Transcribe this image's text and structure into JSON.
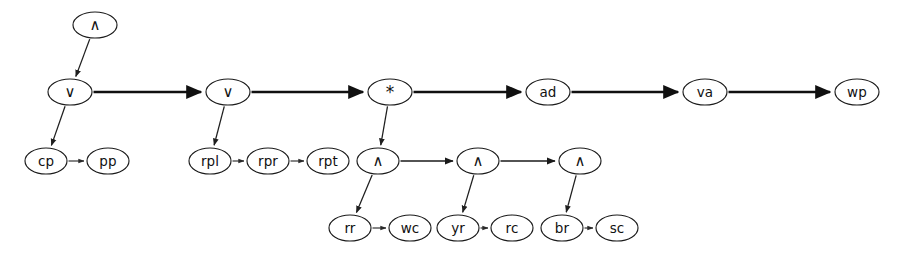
{
  "diagram": {
    "background_color": "#ffffff",
    "stroke_color": "#1b1b1b",
    "width": 906,
    "height": 254,
    "nodes": [
      {
        "id": "and_root",
        "label": "∧",
        "kind": "and-operator",
        "x": 95,
        "y": 25,
        "rx": 22,
        "ry": 13
      },
      {
        "id": "or_1",
        "label": "∨",
        "kind": "or-operator",
        "x": 70,
        "y": 92,
        "rx": 22,
        "ry": 13
      },
      {
        "id": "cp",
        "label": "cp",
        "kind": "leaf",
        "x": 46,
        "y": 161,
        "rx": 21,
        "ry": 13
      },
      {
        "id": "pp",
        "label": "pp",
        "kind": "leaf",
        "x": 108,
        "y": 161,
        "rx": 21,
        "ry": 13
      },
      {
        "id": "or_2",
        "label": "∨",
        "kind": "or-operator",
        "x": 228,
        "y": 92,
        "rx": 22,
        "ry": 13
      },
      {
        "id": "rpl",
        "label": "rpl",
        "kind": "leaf",
        "x": 210,
        "y": 161,
        "rx": 21,
        "ry": 13
      },
      {
        "id": "rpr",
        "label": "rpr",
        "kind": "leaf",
        "x": 268,
        "y": 161,
        "rx": 21,
        "ry": 13
      },
      {
        "id": "rpt",
        "label": "rpt",
        "kind": "leaf",
        "x": 328,
        "y": 161,
        "rx": 21,
        "ry": 13
      },
      {
        "id": "star",
        "label": "*",
        "kind": "star-operator",
        "x": 390,
        "y": 92,
        "rx": 22,
        "ry": 13
      },
      {
        "id": "and_1",
        "label": "∧",
        "kind": "and-operator",
        "x": 378,
        "y": 161,
        "rx": 21,
        "ry": 13
      },
      {
        "id": "rr",
        "label": "rr",
        "kind": "leaf",
        "x": 350,
        "y": 228,
        "rx": 21,
        "ry": 13
      },
      {
        "id": "wc",
        "label": "wc",
        "kind": "leaf",
        "x": 410,
        "y": 228,
        "rx": 21,
        "ry": 13
      },
      {
        "id": "and_2",
        "label": "∧",
        "kind": "and-operator",
        "x": 478,
        "y": 161,
        "rx": 21,
        "ry": 13
      },
      {
        "id": "yr",
        "label": "yr",
        "kind": "leaf",
        "x": 458,
        "y": 228,
        "rx": 21,
        "ry": 13
      },
      {
        "id": "rc",
        "label": "rc",
        "kind": "leaf",
        "x": 512,
        "y": 228,
        "rx": 21,
        "ry": 13
      },
      {
        "id": "and_3",
        "label": "∧",
        "kind": "and-operator",
        "x": 580,
        "y": 161,
        "rx": 21,
        "ry": 13
      },
      {
        "id": "br",
        "label": "br",
        "kind": "leaf",
        "x": 562,
        "y": 228,
        "rx": 21,
        "ry": 13
      },
      {
        "id": "sc",
        "label": "sc",
        "kind": "leaf",
        "x": 617,
        "y": 228,
        "rx": 21,
        "ry": 13
      },
      {
        "id": "ad",
        "label": "ad",
        "kind": "leaf",
        "x": 548,
        "y": 92,
        "rx": 22,
        "ry": 13
      },
      {
        "id": "va",
        "label": "va",
        "kind": "leaf",
        "x": 705,
        "y": 92,
        "rx": 22,
        "ry": 13
      },
      {
        "id": "wp",
        "label": "wp",
        "kind": "leaf",
        "x": 857,
        "y": 92,
        "rx": 22,
        "ry": 13
      }
    ],
    "edges": [
      {
        "id": "e_and_root_or1",
        "from": "and_root",
        "to": "or_1",
        "style": "diagonal"
      },
      {
        "id": "e_or1_cp",
        "from": "or_1",
        "to": "cp",
        "style": "diagonal"
      },
      {
        "id": "e_cp_pp",
        "from": "cp",
        "to": "pp",
        "style": "thin"
      },
      {
        "id": "e_or1_or2",
        "from": "or_1",
        "to": "or_2",
        "style": "thick"
      },
      {
        "id": "e_or2_rpl",
        "from": "or_2",
        "to": "rpl",
        "style": "diagonal"
      },
      {
        "id": "e_rpl_rpr",
        "from": "rpl",
        "to": "rpr",
        "style": "thin"
      },
      {
        "id": "e_rpr_rpt",
        "from": "rpr",
        "to": "rpt",
        "style": "thin"
      },
      {
        "id": "e_or2_star",
        "from": "or_2",
        "to": "star",
        "style": "thick"
      },
      {
        "id": "e_star_and1",
        "from": "star",
        "to": "and_1",
        "style": "diagonal"
      },
      {
        "id": "e_and1_rr",
        "from": "and_1",
        "to": "rr",
        "style": "diagonal"
      },
      {
        "id": "e_rr_wc",
        "from": "rr",
        "to": "wc",
        "style": "thin"
      },
      {
        "id": "e_and1_and2",
        "from": "and_1",
        "to": "and_2",
        "style": "medium"
      },
      {
        "id": "e_and2_yr",
        "from": "and_2",
        "to": "yr",
        "style": "diagonal"
      },
      {
        "id": "e_yr_rc",
        "from": "yr",
        "to": "rc",
        "style": "thin"
      },
      {
        "id": "e_and2_and3",
        "from": "and_2",
        "to": "and_3",
        "style": "medium"
      },
      {
        "id": "e_and3_br",
        "from": "and_3",
        "to": "br",
        "style": "diagonal"
      },
      {
        "id": "e_br_sc",
        "from": "br",
        "to": "sc",
        "style": "thin"
      },
      {
        "id": "e_star_ad",
        "from": "star",
        "to": "ad",
        "style": "thick"
      },
      {
        "id": "e_ad_va",
        "from": "ad",
        "to": "va",
        "style": "thick"
      },
      {
        "id": "e_va_wp",
        "from": "va",
        "to": "wp",
        "style": "thick"
      }
    ]
  }
}
